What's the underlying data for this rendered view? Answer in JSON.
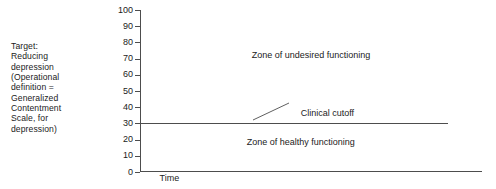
{
  "figure": {
    "target_note": "Target:\nReducing\ndepression\n(Operational\ndefinition =\nGeneralized\nContentment\nScale, for\ndepression)"
  },
  "chart_data": {
    "type": "line",
    "title": "",
    "xlabel": "Time",
    "ylabel": "",
    "ylim": [
      0,
      100
    ],
    "yticks": [
      0,
      10,
      20,
      30,
      40,
      50,
      60,
      70,
      80,
      90,
      100
    ],
    "ytick_labels": [
      "0",
      "10",
      "20",
      "30",
      "40",
      "50",
      "60",
      "70",
      "80",
      "90",
      "100"
    ],
    "xticks": [],
    "xtick_labels": [],
    "grid": false,
    "legend": false,
    "series": [
      {
        "name": "Clinical cutoff",
        "type": "hline",
        "value": 30,
        "color": "#4d4d4d",
        "x_start": 0.0,
        "x_end": 0.9
      }
    ],
    "annotations": [
      {
        "name": "Clinical cutoff",
        "text": "Clinical cutoff",
        "x": 0.47,
        "y": 36,
        "leader": true
      },
      {
        "name": "Zone of undesired functioning",
        "text": "Zone of undesired functioning",
        "x": 0.5,
        "y": 72,
        "leader": false
      },
      {
        "name": "Zone of healthy functioning",
        "text": "Zone of healthy functioning",
        "x": 0.47,
        "y": 18,
        "leader": false
      }
    ],
    "colors": {
      "axis": "#4d4d4d",
      "text": "#1b1b1b",
      "background": "#ffffff"
    }
  }
}
